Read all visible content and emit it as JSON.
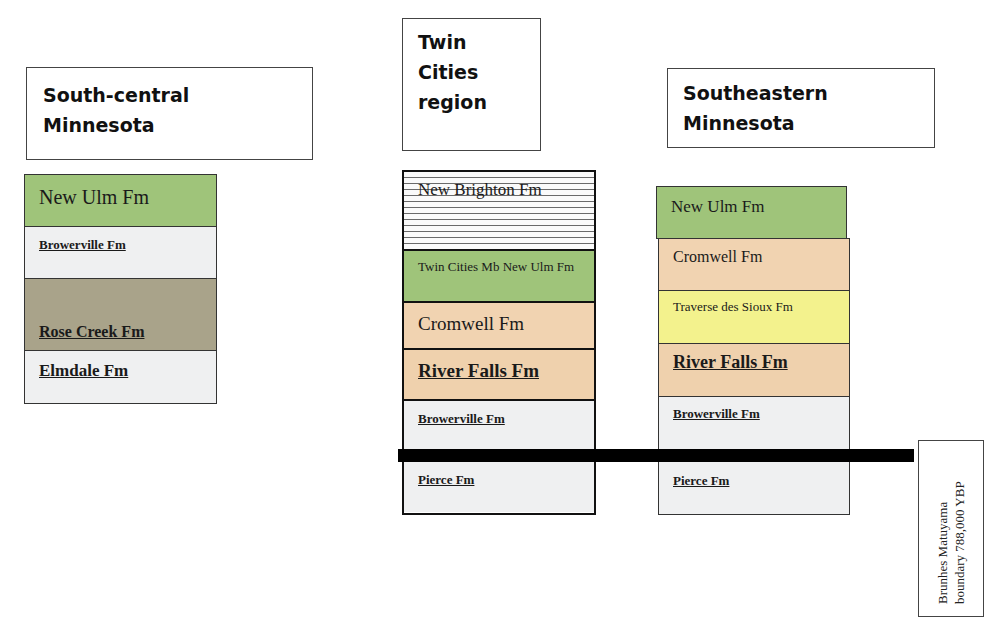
{
  "colors": {
    "new_ulm": "#9fc47a",
    "browerville": "#eff0f1",
    "rose_creek": "#a9a38a",
    "elmdale": "#eff0f1",
    "cromwell": "#f1d3b1",
    "river_falls": "#efd1ad",
    "traverse": "#f3f28d",
    "pierce": "#eff0f1",
    "boundary_bar": "#000000"
  },
  "columns": [
    {
      "header": "South-central\nMinnesota",
      "units": [
        {
          "label": "New Ulm Fm"
        },
        {
          "label": "Browerville Fm"
        },
        {
          "label": "Rose Creek Fm"
        },
        {
          "label": "Elmdale Fm"
        }
      ]
    },
    {
      "header": "Twin\nCities\nregion",
      "units": [
        {
          "label": "New Brighton Fm"
        },
        {
          "label": "Twin Cities Mb New Ulm Fm"
        },
        {
          "label": "Cromwell Fm"
        },
        {
          "label": "River Falls Fm"
        },
        {
          "label": "Browerville Fm"
        },
        {
          "label": "Pierce Fm"
        }
      ]
    },
    {
      "header": "Southeastern\nMinnesota",
      "units": [
        {
          "label": "New Ulm Fm"
        },
        {
          "label": "Cromwell Fm"
        },
        {
          "label": "Traverse des Sioux Fm"
        },
        {
          "label": "River Falls Fm"
        },
        {
          "label": "Browerville Fm"
        },
        {
          "label": "Pierce Fm"
        }
      ]
    }
  ],
  "boundary": {
    "label": "Brunhes Matuyama\nboundary 788,000 YBP"
  }
}
